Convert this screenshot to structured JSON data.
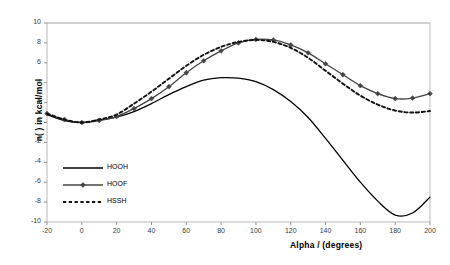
{
  "chart_data": {
    "type": "line",
    "title": "",
    "xlabel": "Alpha / (degrees)",
    "ylabel": "n( ) in kcal/mol",
    "xlim": [
      -20,
      200
    ],
    "ylim": [
      -10,
      10
    ],
    "xticks": [
      -20,
      0,
      20,
      40,
      60,
      80,
      100,
      120,
      140,
      160,
      180,
      200
    ],
    "yticks": [
      -10,
      -8,
      -6,
      -4,
      -2,
      0,
      2,
      4,
      6,
      8,
      10
    ],
    "xtick_labels": [
      "-20",
      "0",
      "20",
      "40",
      "60",
      "80",
      "100",
      "120",
      "140",
      "160",
      "180",
      "200"
    ],
    "ytick_labels": [
      "-10",
      "-8",
      "-6",
      "-4",
      "-2",
      "0",
      "2",
      "4",
      "6",
      "8",
      "10"
    ],
    "grid": "horizontal-top-only",
    "legend_position": "inside-lower-left",
    "x": [
      -20,
      -10,
      0,
      10,
      20,
      30,
      40,
      50,
      60,
      70,
      80,
      90,
      100,
      110,
      120,
      130,
      140,
      150,
      160,
      170,
      180,
      190,
      200
    ],
    "series": [
      {
        "name": "HOOH",
        "style": "solid",
        "marker": "none",
        "color": "#000000",
        "values": [
          0.8,
          0.2,
          0.0,
          0.25,
          0.55,
          1.1,
          1.9,
          2.8,
          3.6,
          4.25,
          4.5,
          4.45,
          4.1,
          3.3,
          2.1,
          0.5,
          -1.6,
          -3.8,
          -6.0,
          -7.9,
          -9.3,
          -9.1,
          -7.5
        ]
      },
      {
        "name": "HOOF",
        "style": "solid",
        "marker": "diamond",
        "color": "#444444",
        "values": [
          0.9,
          0.3,
          0.0,
          0.2,
          0.6,
          1.4,
          2.4,
          3.6,
          5.0,
          6.2,
          7.2,
          8.0,
          8.35,
          8.3,
          7.8,
          7.0,
          5.9,
          4.8,
          3.7,
          2.9,
          2.4,
          2.45,
          2.9
        ]
      },
      {
        "name": "HSSH",
        "style": "dashed",
        "marker": "none",
        "color": "#111111",
        "values": [
          0.9,
          0.3,
          0.0,
          0.3,
          0.8,
          1.9,
          3.1,
          4.4,
          5.7,
          6.8,
          7.6,
          8.1,
          8.3,
          8.1,
          7.5,
          6.5,
          5.2,
          3.9,
          2.7,
          1.8,
          1.2,
          1.0,
          1.15
        ]
      }
    ]
  },
  "legend": {
    "items": [
      {
        "label": "HOOH"
      },
      {
        "label": "HOOF"
      },
      {
        "label": "HSSH"
      }
    ]
  }
}
